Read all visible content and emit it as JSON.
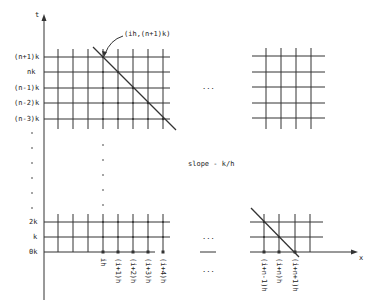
{
  "diagram": {
    "axes": {
      "y_label": "t",
      "x_label": "x"
    },
    "y_ticks_top": [
      "(n+1)k",
      "nk",
      "(n-1)k",
      "(n-2)k",
      "(n-3)k"
    ],
    "y_ticks_bottom": [
      "2k",
      "k",
      "0k"
    ],
    "x_ticks_left": [
      "ih",
      "(i+1)h",
      "(i+2)h",
      "(i+3)h",
      "(i+4)h"
    ],
    "x_ticks_right": [
      "(i+n-1)h",
      "(i+n)h",
      "(i+n+1)h"
    ],
    "annotation_point": "(ih,(n+1)k)",
    "slope_label": "slope - k/h",
    "ellipsis": "..."
  }
}
